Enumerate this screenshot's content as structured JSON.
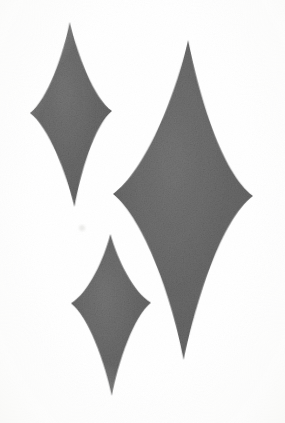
{
  "image": {
    "title": "Four-pointed sparkle stars",
    "width": 285,
    "height": 423,
    "background_color": "#ffffff",
    "paper_tone": "#fbfbfa",
    "medium": "scanned print halftone"
  },
  "palette": {
    "star_fill": "#6b6b6b",
    "star_fill_light": "#787878",
    "star_fill_dark": "#606060",
    "edge_soft": "#8a8a8a",
    "background": "#ffffff",
    "artifact": "#e8e8e6"
  },
  "shapes": [
    {
      "name": "star-top-left",
      "label": "Top-left sparkle",
      "center_x": 72,
      "center_y": 112,
      "top_tip_y": 22,
      "bottom_tip_y": 207,
      "left_tip_x": 30,
      "right_tip_x": 112,
      "half_width": 41,
      "upper_height": 90,
      "lower_height": 95,
      "waist_x": 0.3,
      "waist_y": 0.26,
      "rotation_deg": -1.5,
      "fill": "#6b6b6b"
    },
    {
      "name": "star-large-right",
      "label": "Large right sparkle",
      "center_x": 186,
      "center_y": 195,
      "top_tip_y": 40,
      "bottom_tip_y": 360,
      "left_tip_x": 113,
      "right_tip_x": 253,
      "half_width": 70,
      "upper_height": 155,
      "lower_height": 165,
      "waist_x": 0.31,
      "waist_y": 0.27,
      "rotation_deg": 0.8,
      "fill": "#6b6b6b"
    },
    {
      "name": "star-bottom-left",
      "label": "Bottom-left sparkle",
      "center_x": 111,
      "center_y": 303,
      "top_tip_y": 234,
      "bottom_tip_y": 396,
      "left_tip_x": 71,
      "right_tip_x": 151,
      "half_width": 40,
      "upper_height": 69,
      "lower_height": 93,
      "waist_x": 0.3,
      "waist_y": 0.27,
      "rotation_deg": -0.5,
      "fill": "#6b6b6b"
    }
  ],
  "artifacts": [
    {
      "name": "scan-speck",
      "x": 82,
      "y": 228,
      "radius": 3,
      "color": "#ededeb"
    }
  ]
}
